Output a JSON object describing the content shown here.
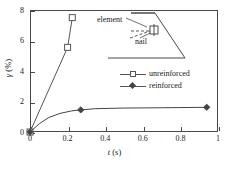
{
  "chart_data": {
    "type": "line",
    "title": "",
    "subtitle": "",
    "xlabel": "t (s)",
    "xlabel_italic": "t",
    "xlabel_unit": " (s)",
    "ylabel": "γ (%)",
    "ylabel_italic": "γ",
    "ylabel_unit": " (%)",
    "xlim": [
      0,
      1
    ],
    "ylim": [
      0,
      8
    ],
    "xticks": [
      "0",
      "0.2",
      "0.4",
      "0.6",
      "0.8",
      "1"
    ],
    "xtick_values": [
      0,
      0.2,
      0.4,
      0.6,
      0.8,
      1
    ],
    "yticks": [
      "0",
      "2",
      "4",
      "6",
      "8"
    ],
    "ytick_values": [
      0,
      2,
      4,
      6,
      8
    ],
    "grid": false,
    "legend_position": "center-right",
    "series": [
      {
        "name": "unreinforced",
        "marker": "open-square",
        "color": "#555555",
        "x": [
          0,
          0.2,
          0.225
        ],
        "y": [
          0,
          5.55,
          7.5
        ]
      },
      {
        "name": "reinforced",
        "marker": "filled-diamond",
        "color": "#444444",
        "x": [
          0,
          0.05,
          0.1,
          0.16,
          0.22,
          0.27,
          0.35,
          0.5,
          0.7,
          0.94
        ],
        "y": [
          0,
          0.55,
          0.95,
          1.22,
          1.38,
          1.45,
          1.53,
          1.57,
          1.59,
          1.62
        ],
        "marker_x": [
          0,
          0.27,
          0.94
        ],
        "marker_y": [
          0,
          1.45,
          1.62
        ]
      }
    ],
    "annotations": [
      {
        "name": "element",
        "text": "element"
      },
      {
        "name": "nail",
        "text": "nail"
      }
    ]
  },
  "legend": {
    "items": [
      {
        "label": "unreinforced",
        "marker": "open-square"
      },
      {
        "label": "reinforced",
        "marker": "filled-diamond"
      }
    ]
  },
  "inset": {
    "name": "slope-schematic",
    "element_label": "element",
    "nail_label": "nail"
  },
  "colors": {
    "axis": "#4a4a4a",
    "series_unreinforced": "#555555",
    "series_reinforced": "#444444",
    "inset_outline": "#4a4a4a",
    "background": "#ffffff"
  }
}
